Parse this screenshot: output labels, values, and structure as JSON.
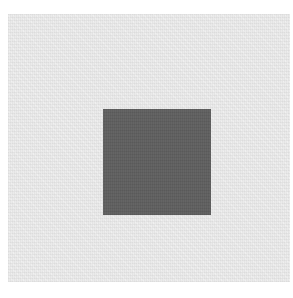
{
  "image": {
    "description": "Dark gray square centered on a lighter gray textured field with white margin",
    "colors": {
      "margin": "#ffffff",
      "field": "#ebebeb",
      "square": "#5f5f5f"
    }
  }
}
